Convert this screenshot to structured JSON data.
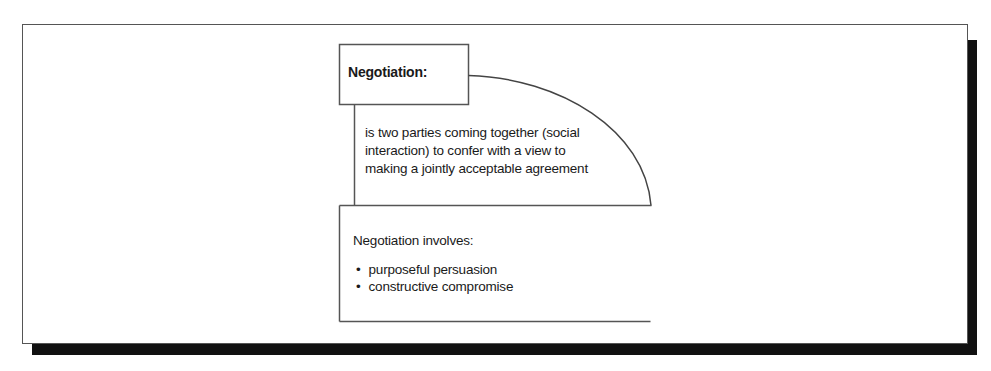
{
  "diagram": {
    "title": "Negotiation:",
    "definition_lines": [
      "is two parties coming together (social",
      "interaction) to confer with a view to",
      "making a jointly acceptable agreement"
    ],
    "involves_heading": "Negotiation involves:",
    "involves_items": [
      "purposeful persuasion",
      "constructive compromise"
    ]
  },
  "colors": {
    "border": "#555555",
    "shadow": "#111111",
    "text": "#1a1a1a",
    "background": "#ffffff"
  }
}
